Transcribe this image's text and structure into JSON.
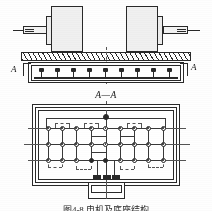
{
  "figure": {
    "domain": "technical-engineering-drawing",
    "caption": "图4-8  电机及底座结构",
    "background_color": "#fdfdfd",
    "line_color": "#2b2b2b"
  },
  "elevation_view": {
    "name": "machine elevation view",
    "section_marker_left_label": "A",
    "section_marker_right_label": "A",
    "machines": [
      {
        "label": "",
        "shaft_side": "left"
      },
      {
        "label": "",
        "shaft_side": "right"
      }
    ],
    "base_plate": {
      "hatched": true
    },
    "bolt_count": 9
  },
  "section_view": {
    "name": "section A-A",
    "title": "A—A",
    "node_grid": {
      "rows": 3,
      "columns": 9
    },
    "node_total": 27,
    "extra_top_node": 1,
    "terminal_pads": 3
  },
  "caption_text": "图4-8  电机及底座结构"
}
